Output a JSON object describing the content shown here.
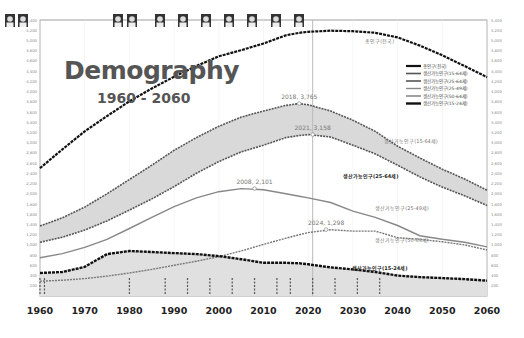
{
  "title": "Demography",
  "subtitle": "1960 - 2060",
  "chart_data": {
    "type": "line",
    "xlabel": "",
    "ylabel": "",
    "xlim": [
      1960,
      2060
    ],
    "ylim": [
      0,
      5400
    ],
    "grid": true,
    "legend_position": "upper right",
    "x_ticks": [
      1960,
      1970,
      1980,
      1990,
      2000,
      2010,
      2020,
      2030,
      2040,
      2050,
      2060
    ],
    "y_ticks": [
      200,
      400,
      600,
      800,
      1000,
      1200,
      1400,
      1600,
      1800,
      2000,
      2200,
      2400,
      2600,
      2800,
      3000,
      3200,
      3400,
      3600,
      3800,
      4000,
      4200,
      4400,
      4600,
      4800,
      5000,
      5200,
      5400
    ],
    "x": [
      1960,
      1965,
      1970,
      1975,
      1980,
      1985,
      1990,
      1995,
      2000,
      2005,
      2010,
      2015,
      2018,
      2020,
      2025,
      2030,
      2035,
      2040,
      2045,
      2050,
      2055,
      2060
    ],
    "series": [
      {
        "name": "총인구(전국)",
        "values": [
          2500,
          2870,
          3220,
          3520,
          3810,
          4060,
          4290,
          4500,
          4690,
          4810,
          4940,
          5100,
          5150,
          5170,
          5190,
          5180,
          5150,
          5060,
          4900,
          4710,
          4500,
          4280
        ]
      },
      {
        "name": "생산가능인구(15-64세)",
        "values": [
          1370,
          1530,
          1740,
          2000,
          2280,
          2560,
          2850,
          3100,
          3320,
          3500,
          3620,
          3730,
          3765,
          3740,
          3620,
          3440,
          3220,
          2930,
          2700,
          2480,
          2290,
          2070
        ]
      },
      {
        "name": "생산가능인구(25-64세)",
        "values": [
          1050,
          1150,
          1290,
          1470,
          1680,
          1900,
          2140,
          2400,
          2630,
          2820,
          2950,
          3100,
          3140,
          3158,
          3110,
          2950,
          2780,
          2560,
          2330,
          2130,
          1960,
          1770
        ]
      },
      {
        "name": "생산가능인구(25-49세)",
        "values": [
          750,
          830,
          950,
          1110,
          1320,
          1540,
          1750,
          1920,
          2040,
          2101,
          2080,
          2000,
          1950,
          1920,
          1830,
          1660,
          1540,
          1380,
          1180,
          1110,
          1050,
          960
        ]
      },
      {
        "name": "생산가능인구(50-64세)",
        "values": [
          290,
          310,
          340,
          390,
          450,
          520,
          600,
          680,
          770,
          880,
          1010,
          1130,
          1200,
          1240,
          1298,
          1270,
          1270,
          1140,
          1110,
          1060,
          1000,
          900
        ]
      },
      {
        "name": "생산가능인구(15-24세)",
        "values": [
          450,
          470,
          570,
          820,
          880,
          860,
          840,
          820,
          780,
          720,
          650,
          650,
          640,
          620,
          560,
          520,
          470,
          400,
          370,
          350,
          330,
          300
        ]
      }
    ],
    "annotations": [
      {
        "text": "2018,  3,765",
        "x": 2018,
        "y": 3765
      },
      {
        "text": "2021,  3,158",
        "x": 2021,
        "y": 3158
      },
      {
        "text": "2008,  2,101",
        "x": 2008,
        "y": 2101
      },
      {
        "text": "2024,  1,298",
        "x": 2024,
        "y": 1298
      },
      {
        "text": "총인구(전국)",
        "x": 2036,
        "y": 4950
      },
      {
        "text": "생산가능인구(15-64세)",
        "x": 2043,
        "y": 3000
      },
      {
        "text": "생산가능인구(25-64세)",
        "x": 2034,
        "y": 2300
      },
      {
        "text": "생산가능인구(25-49세)",
        "x": 2041,
        "y": 1680
      },
      {
        "text": "생산가능인구(50-64세)",
        "x": 2041,
        "y": 1050
      },
      {
        "text": "생산가능인구(15-24세)",
        "x": 2036,
        "y": 500
      }
    ],
    "vertical_marker_x": 2021,
    "shaded_bands": [
      {
        "between": [
          "생산가능인구(15-64세)",
          "생산가능인구(25-64세)"
        ]
      },
      {
        "between": [
          "생산가능인구(15-24세)",
          "baseline"
        ]
      }
    ]
  },
  "portraits_count": 11
}
